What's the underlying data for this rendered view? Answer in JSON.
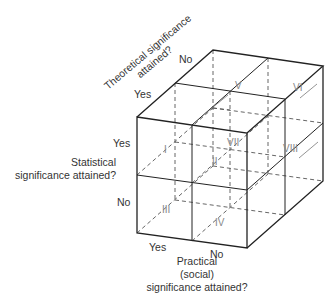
{
  "diagram": {
    "type": "3d-cube-typology",
    "axes": {
      "theoretical": {
        "title_line1": "Theoretical significance",
        "title_line2": "attained?",
        "yes": "Yes",
        "no": "No"
      },
      "statistical": {
        "title_line1": "Statistical",
        "title_line2": "significance attained?",
        "yes": "Yes",
        "no": "No"
      },
      "practical": {
        "title_line1": "Practical",
        "title_line2": "(social)",
        "title_line3": "significance attained?",
        "yes": "Yes",
        "no": "No"
      }
    },
    "cells": [
      "I",
      "II",
      "III",
      "IV",
      "V",
      "VI",
      "VII",
      "VIII"
    ],
    "colors": {
      "edge": "#222222",
      "dashed": "#555555",
      "label": "#333333",
      "roman": "#888888"
    }
  }
}
